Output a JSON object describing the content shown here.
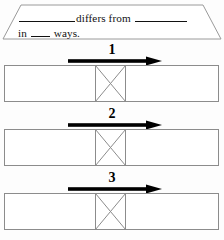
{
  "page": {
    "background_color": "#fdfdfd",
    "width": 224,
    "height": 240
  },
  "header": {
    "shape": "trapezoid",
    "outline_color": "#9a9a9a",
    "line1": {
      "blank_1": "",
      "text_1": "differs from",
      "blank_2": ""
    },
    "line2": {
      "text_prefix": "in",
      "blank_3": "",
      "text_suffix": "ways."
    },
    "full_sentence": "______ differs from ______ in ___ ways."
  },
  "arrow": {
    "color": "#000000",
    "direction": "right"
  },
  "box": {
    "outline_color": "#8c8c8c",
    "fill_color": "#ffffff",
    "middle_cell_marker": "x-cross"
  },
  "sections": [
    {
      "number": "1"
    },
    {
      "number": "2"
    },
    {
      "number": "3"
    }
  ]
}
